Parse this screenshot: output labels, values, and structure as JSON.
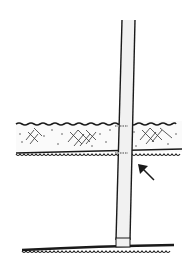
{
  "diagram": {
    "colors": {
      "background": "#ffffff",
      "ink": "#1a1a1a",
      "strap_fill": "#f1f1f1",
      "stitch": "#9a9a9a"
    },
    "elements": {
      "strap": "vertical-strap",
      "band": "lace-band",
      "arrow": "arrow-pointing-to-band-edge",
      "bottom_trim": "scalloped-bottom-trim"
    }
  }
}
